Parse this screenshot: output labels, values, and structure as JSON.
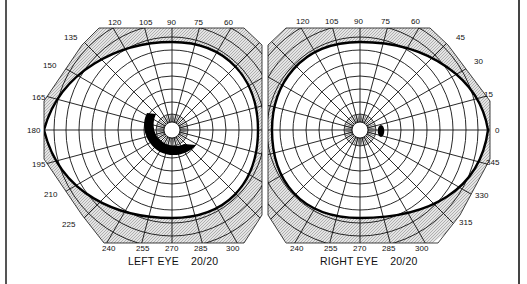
{
  "figure": {
    "type": "visual-field-perimetry-chart"
  },
  "left_eye": {
    "label": "LEFT EYE",
    "acuity": "20/20",
    "angle_labels": [
      "120",
      "105",
      "90",
      "75",
      "60",
      "135",
      "150",
      "165",
      "180",
      "195",
      "210",
      "225",
      "240",
      "255",
      "270",
      "285",
      "300"
    ],
    "scotoma": "large arcuate scotoma inferior-temporal to fixation"
  },
  "right_eye": {
    "label": "RIGHT EYE",
    "acuity": "20/20",
    "angle_labels": [
      "120",
      "105",
      "90",
      "75",
      "60",
      "45",
      "30",
      "15",
      "0",
      "345",
      "330",
      "315",
      "240",
      "255",
      "270",
      "285",
      "300"
    ],
    "scotoma": "small blind spot temporal to fixation"
  },
  "colors": {
    "line": "#111111",
    "hatch": "#cfcfcf",
    "background": "#ffffff"
  }
}
